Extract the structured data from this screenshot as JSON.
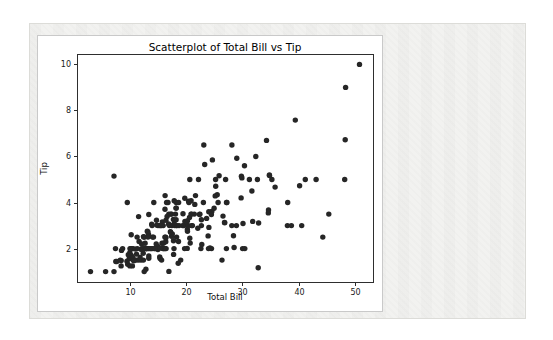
{
  "colors": {
    "page_background": "#ffffff",
    "panel_background": "#f2f2f0",
    "panel_border": "#dcdcd8",
    "figure_background": "#ffffff",
    "figure_border": "#c9c9c9",
    "axis_color": "#2e2e2e",
    "tick_label_color": "#1a1a1a",
    "marker_color": "#262626"
  },
  "chart_data": {
    "type": "scatter",
    "title": "Scatterplot of Total Bill vs Tip",
    "xlabel": "Total Bill",
    "ylabel": "Tip",
    "xlim": [
      0.68,
      53.2
    ],
    "ylim": [
      0.55,
      10.45
    ],
    "x_ticks": [
      10,
      20,
      30,
      40,
      50
    ],
    "y_ticks": [
      2,
      4,
      6,
      8,
      10
    ],
    "grid": false,
    "legend_position": "none",
    "points": [
      [
        16.99,
        1.01
      ],
      [
        10.34,
        1.66
      ],
      [
        21.01,
        3.5
      ],
      [
        23.68,
        3.31
      ],
      [
        24.59,
        3.61
      ],
      [
        25.29,
        4.71
      ],
      [
        8.77,
        2.0
      ],
      [
        26.88,
        3.12
      ],
      [
        15.04,
        1.96
      ],
      [
        14.78,
        3.23
      ],
      [
        10.27,
        1.71
      ],
      [
        35.26,
        5.0
      ],
      [
        15.42,
        1.57
      ],
      [
        18.43,
        3.0
      ],
      [
        14.83,
        3.02
      ],
      [
        21.58,
        3.92
      ],
      [
        10.33,
        1.67
      ],
      [
        16.29,
        3.71
      ],
      [
        16.97,
        3.5
      ],
      [
        20.65,
        3.35
      ],
      [
        17.92,
        4.08
      ],
      [
        20.29,
        2.75
      ],
      [
        15.77,
        2.23
      ],
      [
        39.42,
        7.58
      ],
      [
        19.82,
        3.18
      ],
      [
        17.81,
        2.34
      ],
      [
        13.37,
        2.0
      ],
      [
        12.69,
        2.0
      ],
      [
        21.7,
        4.3
      ],
      [
        19.65,
        3.0
      ],
      [
        9.55,
        1.45
      ],
      [
        18.35,
        2.5
      ],
      [
        15.06,
        3.0
      ],
      [
        20.69,
        2.45
      ],
      [
        17.78,
        3.27
      ],
      [
        24.06,
        3.6
      ],
      [
        16.31,
        2.0
      ],
      [
        16.93,
        3.07
      ],
      [
        18.69,
        2.31
      ],
      [
        31.27,
        5.0
      ],
      [
        16.04,
        2.24
      ],
      [
        17.46,
        2.54
      ],
      [
        13.94,
        3.06
      ],
      [
        9.68,
        1.32
      ],
      [
        30.4,
        5.6
      ],
      [
        18.29,
        3.0
      ],
      [
        22.23,
        5.0
      ],
      [
        32.4,
        6.0
      ],
      [
        28.55,
        2.05
      ],
      [
        18.04,
        3.0
      ],
      [
        12.54,
        2.5
      ],
      [
        10.29,
        2.6
      ],
      [
        34.81,
        5.2
      ],
      [
        9.94,
        1.56
      ],
      [
        25.56,
        4.34
      ],
      [
        19.49,
        3.51
      ],
      [
        38.01,
        3.0
      ],
      [
        26.41,
        1.5
      ],
      [
        11.24,
        1.76
      ],
      [
        48.27,
        6.73
      ],
      [
        20.29,
        3.21
      ],
      [
        13.81,
        2.0
      ],
      [
        11.02,
        1.98
      ],
      [
        18.29,
        3.76
      ],
      [
        17.59,
        2.64
      ],
      [
        20.08,
        3.15
      ],
      [
        16.45,
        2.47
      ],
      [
        3.07,
        1.0
      ],
      [
        20.23,
        2.01
      ],
      [
        15.01,
        2.09
      ],
      [
        12.02,
        1.97
      ],
      [
        17.07,
        3.0
      ],
      [
        26.86,
        3.14
      ],
      [
        25.28,
        5.0
      ],
      [
        14.73,
        2.2
      ],
      [
        10.51,
        1.25
      ],
      [
        17.92,
        3.08
      ],
      [
        27.2,
        4.0
      ],
      [
        22.76,
        3.0
      ],
      [
        17.29,
        2.71
      ],
      [
        19.44,
        3.0
      ],
      [
        16.66,
        3.4
      ],
      [
        10.07,
        1.83
      ],
      [
        32.68,
        5.0
      ],
      [
        15.98,
        2.03
      ],
      [
        34.83,
        5.17
      ],
      [
        13.03,
        2.0
      ],
      [
        18.28,
        4.0
      ],
      [
        24.71,
        5.85
      ],
      [
        21.16,
        3.0
      ],
      [
        28.97,
        3.0
      ],
      [
        22.49,
        3.5
      ],
      [
        5.75,
        1.0
      ],
      [
        16.32,
        4.3
      ],
      [
        22.75,
        3.25
      ],
      [
        40.17,
        4.73
      ],
      [
        27.28,
        4.0
      ],
      [
        12.03,
        1.5
      ],
      [
        21.01,
        3.0
      ],
      [
        12.46,
        1.5
      ],
      [
        11.35,
        2.5
      ],
      [
        15.38,
        3.0
      ],
      [
        44.3,
        2.5
      ],
      [
        22.42,
        3.48
      ],
      [
        20.92,
        4.08
      ],
      [
        15.36,
        1.64
      ],
      [
        20.49,
        4.06
      ],
      [
        25.21,
        4.29
      ],
      [
        18.24,
        3.76
      ],
      [
        14.31,
        4.0
      ],
      [
        14.0,
        3.0
      ],
      [
        7.25,
        1.0
      ],
      [
        38.07,
        4.0
      ],
      [
        23.95,
        2.55
      ],
      [
        25.71,
        4.0
      ],
      [
        17.31,
        3.5
      ],
      [
        29.93,
        5.07
      ],
      [
        10.65,
        1.5
      ],
      [
        12.43,
        1.8
      ],
      [
        24.08,
        2.92
      ],
      [
        11.69,
        2.31
      ],
      [
        13.42,
        1.68
      ],
      [
        14.26,
        2.5
      ],
      [
        15.95,
        2.0
      ],
      [
        12.48,
        2.52
      ],
      [
        29.8,
        4.2
      ],
      [
        8.52,
        1.48
      ],
      [
        14.52,
        2.0
      ],
      [
        11.38,
        2.0
      ],
      [
        22.82,
        2.18
      ],
      [
        19.08,
        1.5
      ],
      [
        20.27,
        2.83
      ],
      [
        11.17,
        1.5
      ],
      [
        12.26,
        2.0
      ],
      [
        18.26,
        3.25
      ],
      [
        8.51,
        1.25
      ],
      [
        10.33,
        2.0
      ],
      [
        14.15,
        2.0
      ],
      [
        16.0,
        2.0
      ],
      [
        13.16,
        2.75
      ],
      [
        17.47,
        3.5
      ],
      [
        34.3,
        6.7
      ],
      [
        41.19,
        5.0
      ],
      [
        27.05,
        5.0
      ],
      [
        16.43,
        2.3
      ],
      [
        8.35,
        1.5
      ],
      [
        18.64,
        1.36
      ],
      [
        11.87,
        1.63
      ],
      [
        9.78,
        1.73
      ],
      [
        7.51,
        2.0
      ],
      [
        14.07,
        2.5
      ],
      [
        13.13,
        2.0
      ],
      [
        17.26,
        2.74
      ],
      [
        24.55,
        2.0
      ],
      [
        19.77,
        2.0
      ],
      [
        29.85,
        5.14
      ],
      [
        48.17,
        5.0
      ],
      [
        25.0,
        3.75
      ],
      [
        13.39,
        2.61
      ],
      [
        16.49,
        2.0
      ],
      [
        21.5,
        3.5
      ],
      [
        12.66,
        2.5
      ],
      [
        16.21,
        2.0
      ],
      [
        13.81,
        2.0
      ],
      [
        17.51,
        3.0
      ],
      [
        24.52,
        3.48
      ],
      [
        20.76,
        2.24
      ],
      [
        31.71,
        4.5
      ],
      [
        10.59,
        1.61
      ],
      [
        10.63,
        2.0
      ],
      [
        50.81,
        10.0
      ],
      [
        15.81,
        3.16
      ],
      [
        7.25,
        5.15
      ],
      [
        31.85,
        3.18
      ],
      [
        16.82,
        4.0
      ],
      [
        32.9,
        3.11
      ],
      [
        17.89,
        2.0
      ],
      [
        14.48,
        2.0
      ],
      [
        9.6,
        4.0
      ],
      [
        34.63,
        3.55
      ],
      [
        34.65,
        3.68
      ],
      [
        23.33,
        5.65
      ],
      [
        45.35,
        3.5
      ],
      [
        23.17,
        6.5
      ],
      [
        40.55,
        3.0
      ],
      [
        20.69,
        5.0
      ],
      [
        20.9,
        3.5
      ],
      [
        30.46,
        2.0
      ],
      [
        18.15,
        3.5
      ],
      [
        23.1,
        4.0
      ],
      [
        15.69,
        1.5
      ],
      [
        19.81,
        4.19
      ],
      [
        28.44,
        2.56
      ],
      [
        15.48,
        2.02
      ],
      [
        16.58,
        4.0
      ],
      [
        7.56,
        1.44
      ],
      [
        10.34,
        2.0
      ],
      [
        43.11,
        5.0
      ],
      [
        13.0,
        2.0
      ],
      [
        13.51,
        2.0
      ],
      [
        18.71,
        4.0
      ],
      [
        12.74,
        2.01
      ],
      [
        13.0,
        2.0
      ],
      [
        16.4,
        2.5
      ],
      [
        20.53,
        4.0
      ],
      [
        16.47,
        3.23
      ],
      [
        26.59,
        3.41
      ],
      [
        38.73,
        3.0
      ],
      [
        24.27,
        2.03
      ],
      [
        12.76,
        2.23
      ],
      [
        30.06,
        2.0
      ],
      [
        25.89,
        5.16
      ],
      [
        48.33,
        9.0
      ],
      [
        13.27,
        2.5
      ],
      [
        28.17,
        6.5
      ],
      [
        12.9,
        1.1
      ],
      [
        28.15,
        3.0
      ],
      [
        11.59,
        1.5
      ],
      [
        7.74,
        1.44
      ],
      [
        30.14,
        3.09
      ],
      [
        12.16,
        2.2
      ],
      [
        13.42,
        3.48
      ],
      [
        8.58,
        1.92
      ],
      [
        15.98,
        3.0
      ],
      [
        13.42,
        1.58
      ],
      [
        16.27,
        2.5
      ],
      [
        10.09,
        2.0
      ],
      [
        20.45,
        3.0
      ],
      [
        13.28,
        2.72
      ],
      [
        22.12,
        2.88
      ],
      [
        24.01,
        2.0
      ],
      [
        15.69,
        3.0
      ],
      [
        11.61,
        3.39
      ],
      [
        10.77,
        1.47
      ],
      [
        15.53,
        3.0
      ],
      [
        10.07,
        1.25
      ],
      [
        12.6,
        1.0
      ],
      [
        32.83,
        1.17
      ],
      [
        35.83,
        4.67
      ],
      [
        29.03,
        5.92
      ],
      [
        27.18,
        2.0
      ],
      [
        22.67,
        2.0
      ],
      [
        17.82,
        1.75
      ],
      [
        18.78,
        3.0
      ]
    ]
  }
}
